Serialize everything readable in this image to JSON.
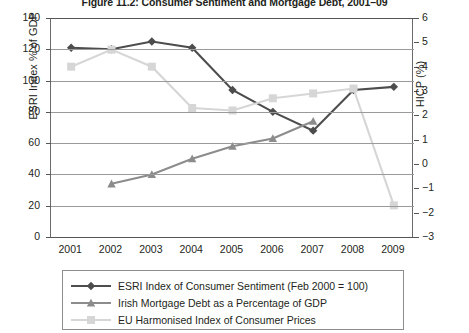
{
  "figure": {
    "title": "Figure 11.2: Consumer Sentiment and Mortgage Debt, 2001–09"
  },
  "axes": {
    "left_title": "ESRI Index % of GDP",
    "right_title": "HICP (%)",
    "left_ticks": [
      "0",
      "20",
      "40",
      "60",
      "80",
      "100",
      "120",
      "140"
    ],
    "right_ticks": [
      "−3",
      "−2",
      "−1",
      "0",
      "1",
      "2",
      "3",
      "4",
      "5",
      "6"
    ],
    "x_ticks": [
      "2001",
      "2002",
      "2003",
      "2004",
      "2005",
      "2006",
      "2007",
      "2008",
      "2009"
    ]
  },
  "legend": {
    "items": [
      {
        "label": "ESRI Index of Consumer Sentiment (Feb 2000 = 100)",
        "marker": "diamond",
        "color": "#4d4d4d"
      },
      {
        "label": "Irish Mortgage Debt as a Percentage of GDP",
        "marker": "triangle",
        "color": "#8c8c8c"
      },
      {
        "label": "EU Harmonised Index of Consumer Prices",
        "marker": "square",
        "color": "#d6d6d6"
      }
    ]
  },
  "chart_data": {
    "type": "line",
    "title": "Figure 11.2: Consumer Sentiment and Mortgage Debt, 2001–09",
    "xlabel": "",
    "ylabel": "ESRI Index % of GDP",
    "y2label": "HICP (%)",
    "x": [
      2001,
      2002,
      2003,
      2004,
      2005,
      2006,
      2007,
      2008,
      2009
    ],
    "ylim": [
      0,
      140
    ],
    "y2lim": [
      -3,
      6
    ],
    "grid": true,
    "legend_position": "bottom",
    "series": [
      {
        "name": "ESRI Index of Consumer Sentiment (Feb 2000 = 100)",
        "axis": "left",
        "marker": "diamond",
        "color": "#4d4d4d",
        "values": [
          121,
          120,
          125,
          121,
          94,
          80,
          68,
          94,
          96
        ]
      },
      {
        "name": "Irish Mortgage Debt as a Percentage of GDP",
        "axis": "left",
        "marker": "triangle",
        "color": "#8c8c8c",
        "values": [
          null,
          34,
          40,
          50,
          58,
          63,
          74,
          null,
          null
        ]
      },
      {
        "name": "EU Harmonised Index of Consumer Prices",
        "axis": "right",
        "marker": "square",
        "color": "#d6d6d6",
        "values": [
          4.0,
          4.7,
          4.0,
          2.3,
          2.2,
          2.7,
          2.9,
          3.1,
          -1.7
        ]
      }
    ]
  }
}
